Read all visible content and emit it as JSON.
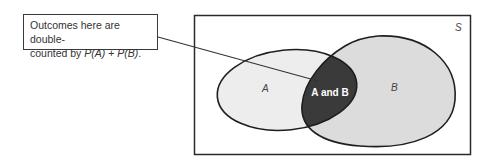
{
  "callout": {
    "line1": "Outcomes here are double-",
    "line2_prefix": "counted by ",
    "pa": "P(A)",
    "plus": " + ",
    "pb": "P(B)",
    "period": "."
  },
  "diagram": {
    "sample_space_label": "S",
    "set_a_label": "A",
    "set_b_label": "B",
    "intersection_label": "A and B",
    "colors": {
      "outline": "#1e1e1e",
      "set_a_fill": "#ededed",
      "set_b_fill": "#dcdcdc",
      "intersection_fill": "#3a3a3a",
      "intersection_text": "#ffffff",
      "label_text": "#444444"
    }
  }
}
